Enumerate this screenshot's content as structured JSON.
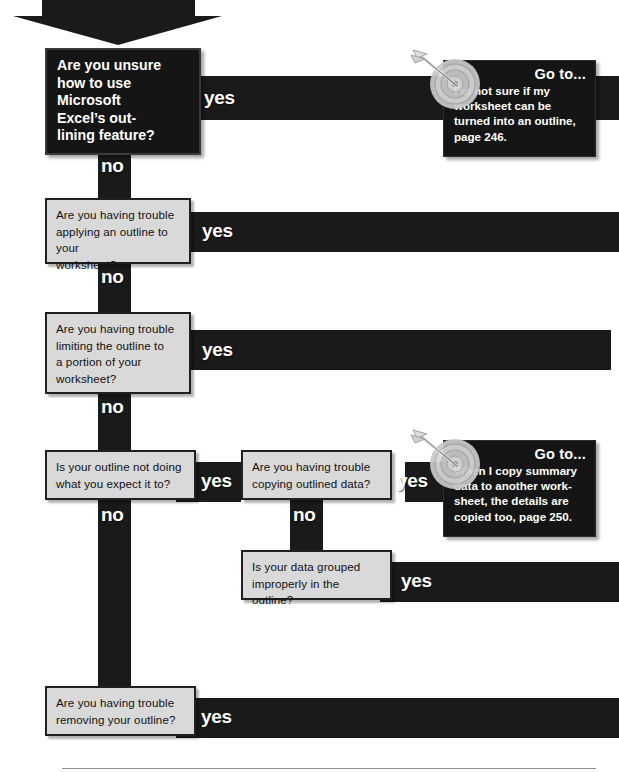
{
  "diagram": {
    "type": "troubleshooting-flowchart",
    "topic": "Microsoft Excel outlining feature",
    "yes_label": "yes",
    "no_label": "no",
    "colors": {
      "bar": "#1a1a1a",
      "box_fill": "#d9d9d9",
      "box_border": "#202020",
      "dark_box_fill": "#151515",
      "text_light": "#ffffff",
      "text_dark": "#111111"
    }
  },
  "entry_arrow": {
    "name": "entry-arrow",
    "direction": "down"
  },
  "nodes": [
    {
      "id": "q1",
      "style": "dark",
      "lines": [
        "Are you unsure",
        "how to use",
        "Microsoft",
        "Excel’s out-",
        "lining feature?"
      ],
      "yes": "yes",
      "no": "no"
    },
    {
      "id": "q2",
      "style": "light",
      "lines": [
        "Are you having trouble",
        "applying an outline to your",
        "worksheet?"
      ],
      "yes": "yes",
      "no": "no"
    },
    {
      "id": "q3",
      "style": "light",
      "lines": [
        "Are you having trouble",
        "limiting the outline to",
        "a portion of your",
        "worksheet?"
      ],
      "yes": "yes",
      "no": "no"
    },
    {
      "id": "q4",
      "style": "light",
      "lines": [
        "Is your outline not doing",
        "what you expect it to?"
      ],
      "yes": "yes",
      "no": "no"
    },
    {
      "id": "q5",
      "style": "light",
      "lines": [
        "Are you having trouble",
        "copying outlined data?"
      ],
      "yes": "yes",
      "no": "no"
    },
    {
      "id": "q6",
      "style": "light",
      "lines": [
        "Is your data grouped",
        "improperly in the outline?"
      ],
      "yes": "yes"
    },
    {
      "id": "q7",
      "style": "light",
      "lines": [
        "Are you having trouble",
        "removing your outline?"
      ],
      "yes": "yes"
    }
  ],
  "callouts": [
    {
      "id": "goto1",
      "title": "Go to...",
      "lines": [
        "I’m not sure if my",
        "worksheet can be",
        "turned into an outline,",
        "page 246."
      ],
      "page": "246",
      "icon": "target-with-arrow-icon"
    },
    {
      "id": "goto2",
      "title": "Go to...",
      "lines": [
        "When I copy summary",
        "data to another work-",
        "sheet, the details are",
        "copied too, page 250."
      ],
      "page": "250",
      "icon": "target-with-arrow-icon"
    }
  ]
}
